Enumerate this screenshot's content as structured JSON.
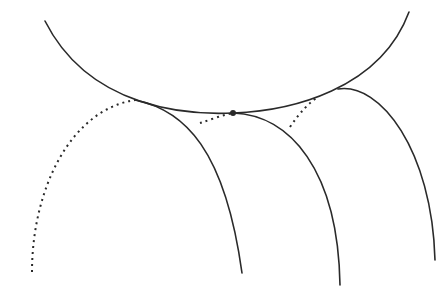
{
  "diagram": {
    "title": "",
    "colors": {
      "stroke": "#2a2a2a",
      "background": "#ffffff"
    },
    "envelope": {
      "path": "M 45 21 C 90 110, 190 115, 233 113 C 290 111, 380 90, 409 12"
    },
    "curves": [
      {
        "name": "left-curve",
        "solid_path": "M 135 100 C 185 110, 225 150, 242 273",
        "dotted_path": "M 32 272 C 32 190, 70 110, 135 100"
      },
      {
        "name": "middle-curve",
        "solid_path": "M 233 113 C 290 115, 338 170, 340 285",
        "dotted_path": "M 200 123 C 210 120, 222 115, 233 113"
      },
      {
        "name": "right-curve",
        "solid_path": "M 338 89 C 380 82, 432 150, 435 260",
        "dotted_path": "M 290 127 C 300 112, 310 102, 318 97"
      }
    ],
    "tangent_point": {
      "cx": 233,
      "cy": 113,
      "r": 3
    }
  }
}
